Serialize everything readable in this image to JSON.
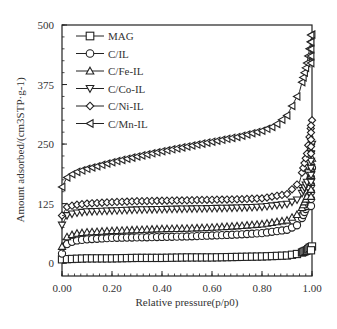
{
  "chart_data": {
    "type": "line",
    "title": "",
    "xlabel": "Relative pressure(p/p0)",
    "ylabel": "Amount adsorbed/(cm3STP·g-1)",
    "xlim": [
      0,
      1.0
    ],
    "ylim": [
      -27,
      500
    ],
    "xticks": [
      "0.00",
      "0.20",
      "0.40",
      "0.60",
      "0.80",
      "1.00"
    ],
    "yticks": [
      "0",
      "125",
      "250",
      "375",
      "500"
    ],
    "grid": false,
    "legend_position": "upper left",
    "series": [
      {
        "name": "MAG",
        "marker": "square",
        "x": [
          0.0,
          0.05,
          0.1,
          0.2,
          0.3,
          0.4,
          0.5,
          0.6,
          0.7,
          0.8,
          0.9,
          0.95,
          0.98,
          0.99,
          1.0
        ],
        "y": [
          8,
          9,
          10,
          10,
          11,
          11,
          12,
          12,
          13,
          14,
          16,
          20,
          27,
          32,
          35
        ]
      },
      {
        "name": "C/IL",
        "marker": "circle",
        "x": [
          0.0,
          0.02,
          0.05,
          0.1,
          0.2,
          0.3,
          0.4,
          0.5,
          0.6,
          0.7,
          0.8,
          0.9,
          0.95,
          0.98,
          1.0
        ],
        "y": [
          20,
          40,
          47,
          50,
          53,
          54,
          55,
          56,
          58,
          60,
          63,
          70,
          82,
          120,
          200
        ]
      },
      {
        "name": "C/Fe-IL",
        "marker": "triangle-up",
        "x": [
          0.0,
          0.02,
          0.05,
          0.1,
          0.2,
          0.3,
          0.4,
          0.5,
          0.6,
          0.7,
          0.8,
          0.9,
          0.95,
          0.98,
          1.0
        ],
        "y": [
          35,
          55,
          62,
          65,
          68,
          70,
          72,
          73,
          75,
          78,
          82,
          90,
          105,
          140,
          220
        ]
      },
      {
        "name": "C/Co-IL",
        "marker": "triangle-down",
        "x": [
          0.0,
          0.02,
          0.05,
          0.1,
          0.2,
          0.3,
          0.4,
          0.5,
          0.6,
          0.7,
          0.8,
          0.9,
          0.95,
          0.98,
          1.0
        ],
        "y": [
          80,
          100,
          105,
          108,
          110,
          112,
          113,
          114,
          115,
          116,
          118,
          124,
          135,
          170,
          250
        ]
      },
      {
        "name": "C/Ni-IL",
        "marker": "diamond",
        "x": [
          0.0,
          0.02,
          0.05,
          0.1,
          0.2,
          0.3,
          0.4,
          0.5,
          0.6,
          0.7,
          0.8,
          0.9,
          0.95,
          0.98,
          1.0
        ],
        "y": [
          100,
          118,
          122,
          125,
          128,
          130,
          131,
          132,
          133,
          134,
          136,
          145,
          170,
          230,
          300
        ]
      },
      {
        "name": "C/Mn-IL",
        "marker": "triangle-left",
        "x": [
          0.0,
          0.02,
          0.05,
          0.1,
          0.2,
          0.3,
          0.4,
          0.5,
          0.6,
          0.7,
          0.8,
          0.85,
          0.9,
          0.95,
          0.98,
          1.0
        ],
        "y": [
          160,
          180,
          190,
          198,
          212,
          224,
          235,
          245,
          255,
          265,
          278,
          288,
          310,
          360,
          420,
          480
        ]
      }
    ]
  }
}
